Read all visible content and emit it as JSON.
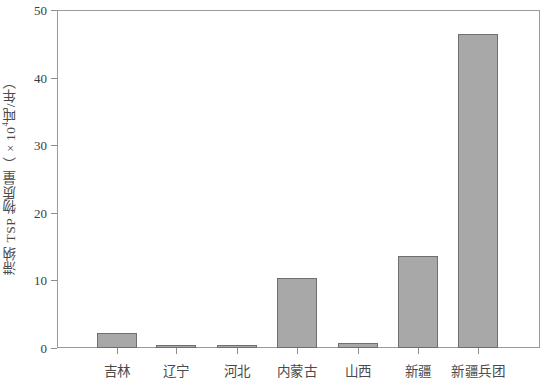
{
  "chart_data": {
    "type": "bar",
    "title": "",
    "xlabel": "",
    "ylabel": "滞纳TSP物质量（×10⁴吨/年）",
    "ylabel_prefix": "滞纳 TSP 物质量（×10",
    "ylabel_exponent": "4",
    "ylabel_suffix": "吨/年）",
    "categories": [
      "吉林",
      "辽宁",
      "河北",
      "内蒙古",
      "山西",
      "新疆",
      "新疆兵团"
    ],
    "values": [
      2.2,
      0.4,
      0.4,
      10.4,
      0.7,
      13.6,
      46.4
    ],
    "ylim": [
      0,
      50
    ],
    "yticks": [
      0,
      10,
      20,
      30,
      40,
      50
    ],
    "ytick_labels": [
      "0",
      "10",
      "20",
      "30",
      "40",
      "50"
    ],
    "grid": false,
    "legend": "none",
    "series": [
      {
        "name": "滞纳TSP物质量",
        "values": [
          2.2,
          0.4,
          0.4,
          10.4,
          0.7,
          13.6,
          46.4
        ]
      }
    ],
    "colors": {
      "bar_fill": "#a8a8a8",
      "bar_stroke": "#6f6f6f",
      "axis": "#9a9a9a",
      "text": "#3c3c3c",
      "background": "#ffffff"
    }
  }
}
